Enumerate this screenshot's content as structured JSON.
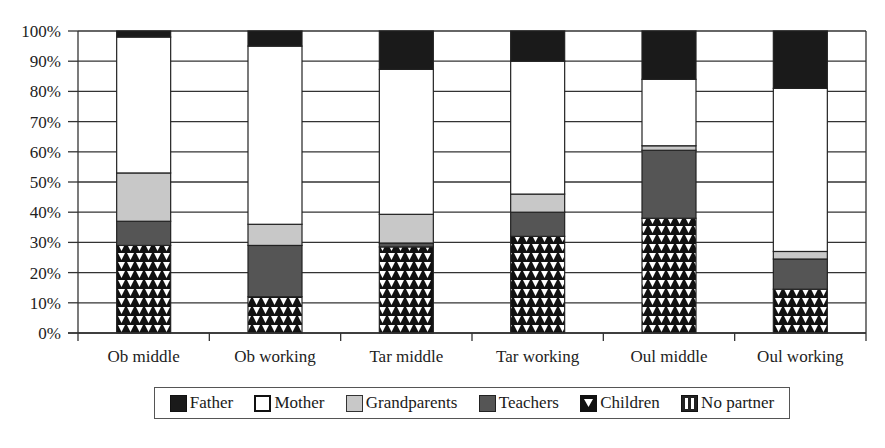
{
  "chart_data": {
    "type": "bar",
    "stacked": true,
    "percent": true,
    "title": "",
    "xlabel": "",
    "ylabel": "",
    "ylim": [
      0,
      100
    ],
    "yticks": [
      "0%",
      "10%",
      "20%",
      "30%",
      "40%",
      "50%",
      "60%",
      "70%",
      "80%",
      "90%",
      "100%"
    ],
    "grid": "horizontal",
    "legend_position": "bottom",
    "categories": [
      "Ob middle",
      "Ob working",
      "Tar middle",
      "Tar working",
      "Oul middle",
      "Oul working"
    ],
    "series": [
      {
        "name": "Children",
        "pattern": "triangles",
        "color": "#111111",
        "values": [
          29,
          12,
          28.5,
          32,
          38,
          14.5
        ]
      },
      {
        "name": "Teachers",
        "color": "#555555",
        "values": [
          8,
          17,
          1.3,
          8,
          22.5,
          10
        ]
      },
      {
        "name": "Grandparents",
        "color": "#c8c8c8",
        "values": [
          16,
          7,
          9.5,
          6,
          1.5,
          2.5
        ]
      },
      {
        "name": "Mother",
        "color": "#ffffff",
        "values": [
          45,
          59,
          48,
          44,
          22,
          54
        ]
      },
      {
        "name": "Father",
        "color": "#1a1a1a",
        "values": [
          2,
          5,
          12.7,
          10,
          16,
          19
        ]
      },
      {
        "name": "No partner",
        "pattern": "vertical-stripes",
        "color": "#444444",
        "values": [
          0,
          0,
          0,
          0,
          0,
          0
        ]
      }
    ]
  },
  "legend": {
    "items": [
      {
        "label": "Father",
        "swatch": "solid-black"
      },
      {
        "label": "Mother",
        "swatch": "white"
      },
      {
        "label": "Grandparents",
        "swatch": "light-gray"
      },
      {
        "label": "Teachers",
        "swatch": "dark-gray"
      },
      {
        "label": "Children",
        "swatch": "triangle-pattern"
      },
      {
        "label": "No partner",
        "swatch": "vertical-stripes"
      }
    ]
  }
}
